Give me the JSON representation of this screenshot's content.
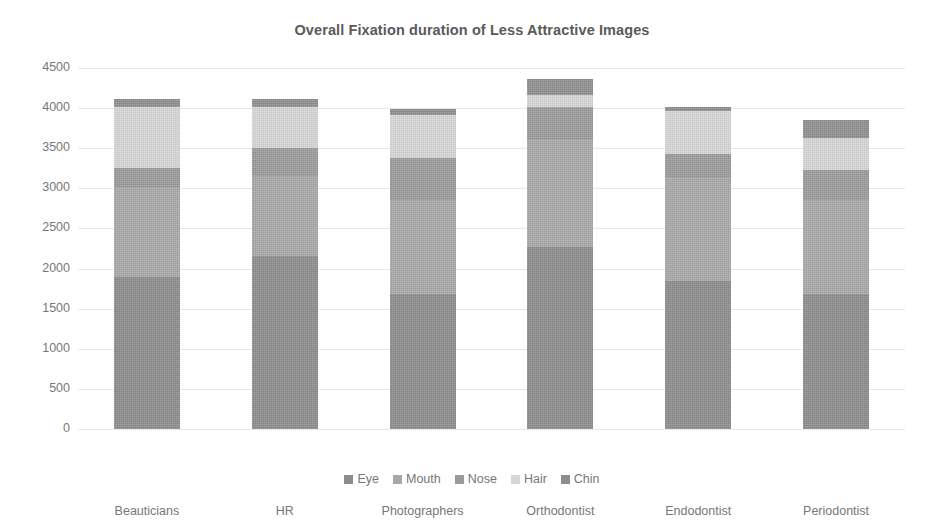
{
  "chart_data": {
    "type": "bar",
    "subtype": "stacked-vertical",
    "title": "Overall Fixation duration of Less Attractive Images",
    "xlabel": "",
    "ylabel": "",
    "ylim": [
      0,
      4500
    ],
    "ytick_step": 500,
    "ytick_labels": [
      "4500",
      "4000",
      "3500",
      "3000",
      "2500",
      "2000",
      "1500",
      "1000",
      "500",
      "0"
    ],
    "grid": true,
    "grid_axis": "y",
    "legend_position": "bottom",
    "legend_entries": [
      "Eye",
      "Mouth",
      "Nose",
      "Hair",
      "Chin"
    ],
    "categories": [
      "Beauticians",
      "HR",
      "Photographers",
      "Orthodontist",
      "Endodontist",
      "Periodontist"
    ],
    "series": [
      {
        "name": "Eye",
        "color": "#8c8c8c",
        "values": [
          1900,
          2160,
          1680,
          2270,
          1840,
          1680
        ]
      },
      {
        "name": "Mouth",
        "color": "#a8a8a8",
        "values": [
          1100,
          1000,
          1170,
          1330,
          1290,
          1180
        ]
      },
      {
        "name": "Nose",
        "color": "#9a9a9a",
        "values": [
          250,
          340,
          530,
          410,
          300,
          370
        ]
      },
      {
        "name": "Hair",
        "color": "#d6d6d6",
        "values": [
          770,
          520,
          540,
          160,
          530,
          400
        ]
      },
      {
        "name": "Chin",
        "color": "#8e8e8e",
        "values": [
          90,
          100,
          70,
          190,
          50,
          220
        ]
      }
    ],
    "totals": [
      4110,
      4120,
      3990,
      4360,
      4010,
      3850
    ]
  },
  "colors": {
    "title_text": "#5a5a5a",
    "axis_text": "#777777",
    "gridline": "#e8e8e8",
    "background": "#ffffff"
  }
}
